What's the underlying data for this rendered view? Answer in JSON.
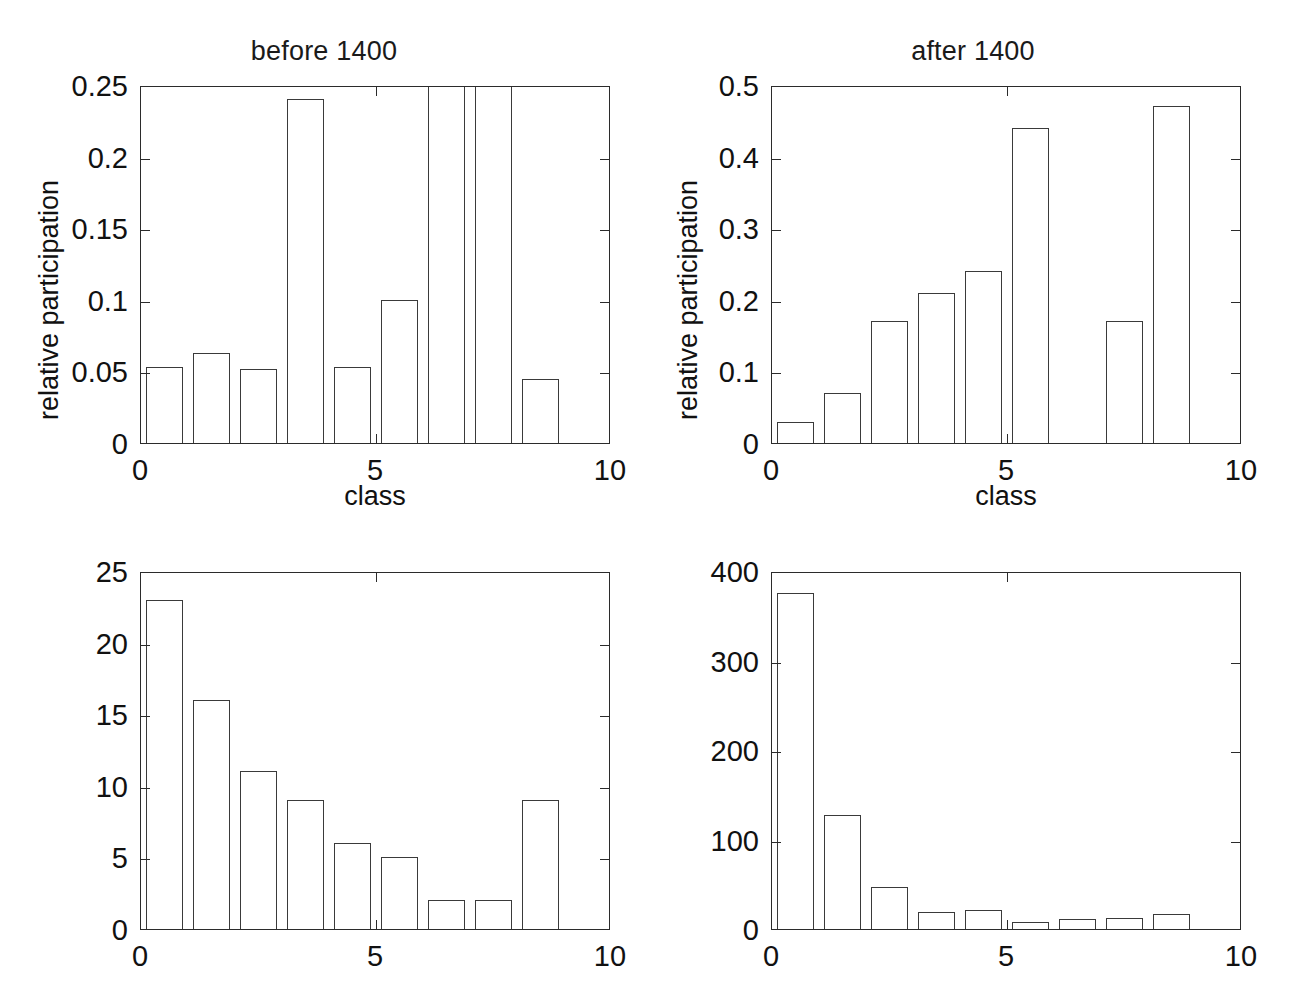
{
  "figure": {
    "background": "#ffffff",
    "line_color": "#2b2b2b",
    "bar_edge_color": "#3a3a3a",
    "bar_fill": "none"
  },
  "panels": [
    {
      "id": "top-left",
      "title": "before 1400",
      "xlabel": "class",
      "ylabel": "relative participation",
      "xticklabels": [
        "0",
        "5",
        "10"
      ],
      "yticklabels": [
        "0",
        "0.05",
        "0.1",
        "0.15",
        "0.2",
        "0.25"
      ]
    },
    {
      "id": "top-right",
      "title": "after 1400",
      "xlabel": "class",
      "ylabel": "relative participation",
      "xticklabels": [
        "0",
        "5",
        "10"
      ],
      "yticklabels": [
        "0",
        "0.1",
        "0.2",
        "0.3",
        "0.4",
        "0.5"
      ]
    },
    {
      "id": "bottom-left",
      "title": "",
      "xlabel": "",
      "ylabel": "",
      "xticklabels": [
        "0",
        "5",
        "10"
      ],
      "yticklabels": [
        "0",
        "5",
        "10",
        "15",
        "20",
        "25"
      ]
    },
    {
      "id": "bottom-right",
      "title": "",
      "xlabel": "",
      "ylabel": "",
      "xticklabels": [
        "0",
        "5",
        "10"
      ],
      "yticklabels": [
        "0",
        "100",
        "200",
        "300",
        "400"
      ]
    }
  ],
  "chart_data": [
    {
      "type": "bar",
      "id": "top-left",
      "title": "before 1400",
      "xlabel": "class",
      "ylabel": "relative participation",
      "categories": [
        1,
        2,
        3,
        4,
        5,
        6,
        7,
        8,
        9
      ],
      "values": [
        0.053,
        0.063,
        0.052,
        0.24,
        0.053,
        0.1,
        0.3,
        0.3,
        0.045
      ],
      "clipped_bars": [
        7,
        8
      ],
      "clipped_note": "bars at class 7 and 8 extend above the y-axis limit of 0.25 and are drawn clipped as narrow vertical lines",
      "xlim": [
        0,
        10
      ],
      "ylim": [
        0,
        0.25
      ],
      "xticks": [
        0,
        5,
        10
      ],
      "yticks": [
        0,
        0.05,
        0.1,
        0.15,
        0.2,
        0.25
      ],
      "grid": false,
      "legend": "none"
    },
    {
      "type": "bar",
      "id": "top-right",
      "title": "after 1400",
      "xlabel": "class",
      "ylabel": "relative participation",
      "categories": [
        1,
        2,
        3,
        4,
        5,
        6,
        7,
        8,
        9
      ],
      "values": [
        0.03,
        0.07,
        0.17,
        0.21,
        0.24,
        0.44,
        0.0,
        0.17,
        0.47
      ],
      "xlim": [
        0,
        10
      ],
      "ylim": [
        0,
        0.5
      ],
      "xticks": [
        0,
        5,
        10
      ],
      "yticks": [
        0,
        0.1,
        0.2,
        0.3,
        0.4,
        0.5
      ],
      "grid": false,
      "legend": "none"
    },
    {
      "type": "bar",
      "id": "bottom-left",
      "title": "",
      "xlabel": "",
      "ylabel": "",
      "categories": [
        1,
        2,
        3,
        4,
        5,
        6,
        7,
        8,
        9
      ],
      "values": [
        23,
        16,
        11,
        9,
        6,
        5,
        2,
        2,
        9
      ],
      "xlim": [
        0,
        10
      ],
      "ylim": [
        0,
        25
      ],
      "xticks": [
        0,
        5,
        10
      ],
      "yticks": [
        0,
        5,
        10,
        15,
        20,
        25
      ],
      "grid": false,
      "legend": "none"
    },
    {
      "type": "bar",
      "id": "bottom-right",
      "title": "",
      "xlabel": "",
      "ylabel": "",
      "categories": [
        1,
        2,
        3,
        4,
        5,
        6,
        7,
        8,
        9
      ],
      "values": [
        375,
        127,
        47,
        19,
        21,
        8,
        11,
        12,
        17
      ],
      "xlim": [
        0,
        10
      ],
      "ylim": [
        0,
        400
      ],
      "xticks": [
        0,
        5,
        10
      ],
      "yticks": [
        0,
        100,
        200,
        300,
        400
      ],
      "grid": false,
      "legend": "none"
    }
  ]
}
